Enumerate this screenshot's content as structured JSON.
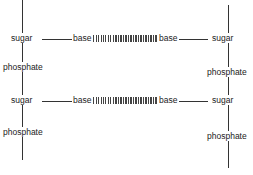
{
  "diagram": {
    "title": "",
    "labels": {
      "sugar": "sugar",
      "phosphate": "phosphate",
      "base": "base"
    },
    "left_strand": {
      "nodes": [
        "sugar",
        "phosphate",
        "sugar",
        "phosphate"
      ]
    },
    "right_strand": {
      "nodes": [
        "sugar",
        "phosphate",
        "sugar",
        "phosphate"
      ]
    },
    "rungs": [
      {
        "left_sugar": "sugar",
        "left_base": "base",
        "bond": "hydrogen-bonds",
        "right_base": "base",
        "right_sugar": "sugar"
      },
      {
        "left_sugar": "sugar",
        "left_base": "base",
        "bond": "hydrogen-bonds",
        "right_base": "base",
        "right_sugar": "sugar"
      }
    ],
    "colors": {
      "line": "#333333",
      "text": "#222222",
      "background": "#ffffff"
    }
  }
}
